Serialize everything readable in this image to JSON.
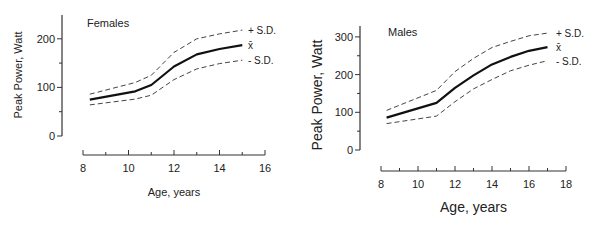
{
  "chart_data": [
    {
      "type": "line",
      "title": "Females",
      "xlabel": "Age, years",
      "ylabel": "Peak Power, Watt",
      "xlim": [
        8,
        16
      ],
      "ylim": [
        0,
        250
      ],
      "xticks": [
        8,
        10,
        12,
        14,
        16
      ],
      "yticks": [
        0,
        100,
        200
      ],
      "grid": false,
      "legend": [
        "+ S.D.",
        "x̄",
        "- S.D."
      ],
      "x": [
        8.3,
        10.3,
        11,
        12,
        13,
        14,
        15
      ],
      "series": [
        {
          "name": "+ S.D.",
          "style": "dashed",
          "values": [
            86,
            110,
            125,
            172,
            200,
            210,
            218
          ]
        },
        {
          "name": "x̄",
          "style": "solid",
          "values": [
            75,
            92,
            105,
            143,
            168,
            179,
            187
          ]
        },
        {
          "name": "- S.D.",
          "style": "dashed",
          "values": [
            64,
            76,
            84,
            116,
            138,
            149,
            156
          ]
        }
      ]
    },
    {
      "type": "line",
      "title": "Males",
      "xlabel": "Age, years",
      "ylabel": "Peak Power, Watt",
      "xlim": [
        8,
        18
      ],
      "ylim": [
        0,
        320
      ],
      "xticks": [
        8,
        10,
        12,
        14,
        16,
        18
      ],
      "yticks": [
        0,
        100,
        200,
        300
      ],
      "grid": false,
      "legend": [
        "+ S.D.",
        "x̄",
        "- S.D."
      ],
      "x": [
        8.3,
        11,
        12,
        13,
        14,
        15,
        16,
        17
      ],
      "series": [
        {
          "name": "+ S.D.",
          "style": "dashed",
          "values": [
            105,
            158,
            208,
            243,
            272,
            288,
            303,
            310
          ]
        },
        {
          "name": "x̄",
          "style": "solid",
          "values": [
            86,
            125,
            165,
            198,
            227,
            247,
            263,
            273
          ]
        },
        {
          "name": "- S.D.",
          "style": "dashed",
          "values": [
            70,
            90,
            128,
            162,
            187,
            210,
            225,
            237
          ]
        }
      ]
    }
  ],
  "layout": [
    {
      "x0": 83,
      "x1": 265,
      "y0": 136,
      "pxPerY": 0.486,
      "yAxisX": 62,
      "yTop": 15,
      "xAxisY": 155,
      "titlePos": [
        87,
        27
      ],
      "legendX": 248,
      "ylabelX": 22,
      "ylabelY": 75,
      "xlabelY": 196,
      "fontMain": 11,
      "fontTick": 11
    },
    {
      "x0": 381,
      "x1": 566,
      "y0": 150,
      "pxPerY": 0.377,
      "yAxisX": 360,
      "yTop": 26,
      "xAxisY": 171,
      "titlePos": [
        388,
        36
      ],
      "legendX": 556,
      "ylabelX": 322,
      "ylabelY": 95,
      "xlabelY": 212,
      "fontMain": 14,
      "fontTick": 11
    }
  ]
}
